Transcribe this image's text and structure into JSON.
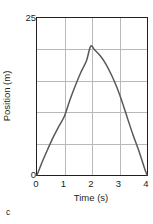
{
  "panel": {
    "letter": "c"
  },
  "chart_data": {
    "type": "line",
    "title": "",
    "subtitle": "",
    "xlabel": "Time (s)",
    "ylabel": "Position (m)",
    "xlim": [
      0,
      4
    ],
    "ylim": [
      0,
      25
    ],
    "xticks": [
      0,
      1,
      2,
      3,
      4
    ],
    "xtick_labels": [
      "0",
      "1",
      "2",
      "3",
      "4"
    ],
    "yticks": [
      0,
      25
    ],
    "ytick_labels": [
      "0",
      "25"
    ],
    "y_gridlines": [
      5,
      10,
      15,
      20
    ],
    "x_gridlines": [
      1,
      2,
      3
    ],
    "grid": true,
    "legend": null,
    "annotations": [],
    "series": [
      {
        "name": "Position vs time",
        "color": "#58595b",
        "line_width": 1.5,
        "marker": "none",
        "x": [
          0,
          0.2,
          0.4,
          0.6,
          0.8,
          1.0,
          1.2,
          1.4,
          1.6,
          1.8,
          1.95,
          2.1,
          2.3,
          2.5,
          2.7,
          2.9,
          3.1,
          3.3,
          3.5,
          3.7,
          3.9,
          4.0
        ],
        "y": [
          0.0,
          2.2,
          4.2,
          6.1,
          7.8,
          9.4,
          12.0,
          14.3,
          16.4,
          18.2,
          20.5,
          19.9,
          19.0,
          17.7,
          16.0,
          14.0,
          11.6,
          8.9,
          6.3,
          3.9,
          1.2,
          0.0
        ]
      }
    ],
    "peak": {
      "x": 1.95,
      "y": 20.5
    }
  }
}
